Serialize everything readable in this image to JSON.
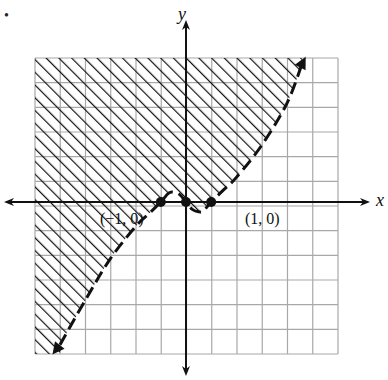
{
  "bullet": "•",
  "chart_data": {
    "type": "line",
    "title": "",
    "xlabel": "x",
    "ylabel": "y",
    "xlim": [
      -6,
      6
    ],
    "ylim": [
      -6,
      6
    ],
    "grid": true,
    "grid_step": 1,
    "curve": {
      "style": "dashed",
      "description": "cubic-like boundary through (-1,0), (0,0), (1,0); local max near (-0.5, 0.4), local min near (0.5, -0.4); arrows at both ends",
      "points": [
        [
          -5.0,
          -5.8
        ],
        [
          -4.0,
          -4.0
        ],
        [
          -3.0,
          -2.3
        ],
        [
          -2.0,
          -1.0
        ],
        [
          -1.5,
          -0.5
        ],
        [
          -1.0,
          0.0
        ],
        [
          -0.7,
          0.35
        ],
        [
          -0.5,
          0.4
        ],
        [
          -0.25,
          0.3
        ],
        [
          0.0,
          0.0
        ],
        [
          0.25,
          -0.3
        ],
        [
          0.5,
          -0.4
        ],
        [
          0.7,
          -0.35
        ],
        [
          1.0,
          0.0
        ],
        [
          1.5,
          0.5
        ],
        [
          2.0,
          1.0
        ],
        [
          3.0,
          2.3
        ],
        [
          4.0,
          4.0
        ],
        [
          4.6,
          5.6
        ]
      ]
    },
    "shaded_region": "above/left of curve (hatched)",
    "points": [
      {
        "label": "(−1, 0)",
        "x": -1,
        "y": 0
      },
      {
        "label": "(0, 0)",
        "x": 0,
        "y": 0
      },
      {
        "label": "(1, 0)",
        "x": 1,
        "y": 0
      }
    ],
    "annotations": [
      "(−1, 0)",
      "(1, 0)"
    ]
  },
  "labels": {
    "x_axis": "x",
    "y_axis": "y",
    "point_neg1": "(−1, 0)",
    "point_pos1": "(1, 0)"
  },
  "colors": {
    "grid": "#a8a8a8",
    "ink": "#111111",
    "background": "#ffffff"
  }
}
